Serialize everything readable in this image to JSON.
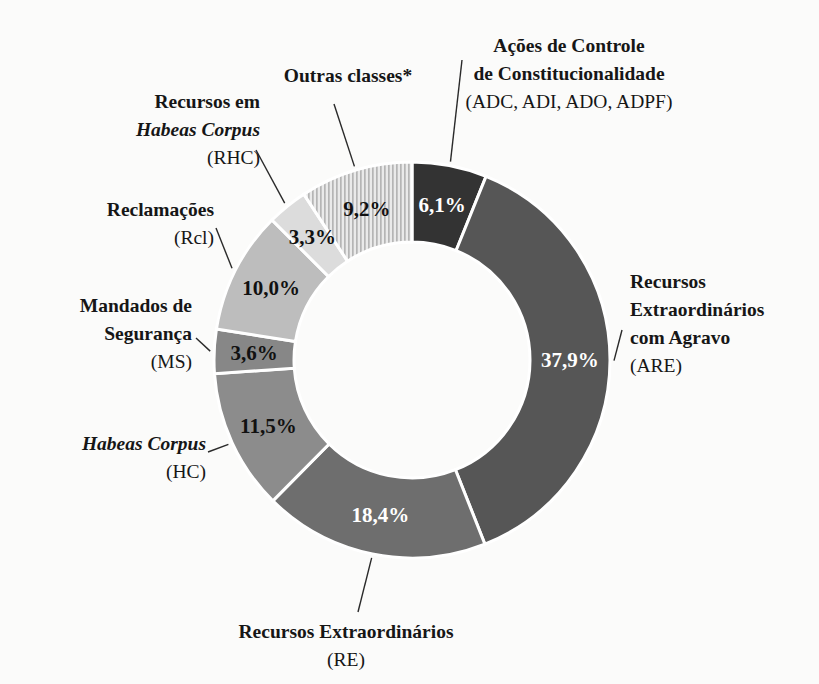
{
  "chart_data": {
    "type": "pie",
    "variant": "donut",
    "title": "",
    "subtitle": "",
    "xlabel": "",
    "ylabel": "",
    "legend_position": "callout-labels",
    "grid": false,
    "value_suffix": "%",
    "decimal_separator": ",",
    "start_angle_deg": 0,
    "direction": "clockwise",
    "categories": [
      "Ações de Controle de Constitucionalidade (ADC, ADI, ADO, ADPF)",
      "Recursos Extraordinários com Agravo (ARE)",
      "Recursos Extraordinários (RE)",
      "Habeas Corpus (HC)",
      "Mandados de Segurança (MS)",
      "Reclamações (Rcl)",
      "Recursos em Habeas Corpus (RHC)",
      "Outras classes*"
    ],
    "values": [
      6.1,
      37.9,
      18.4,
      11.5,
      3.6,
      10.0,
      3.3,
      9.2
    ],
    "value_labels": [
      "6,1%",
      "37,9%",
      "18,4%",
      "11,5%",
      "3,6%",
      "10,0%",
      "3,3%",
      "9,2%"
    ],
    "slice_colors": [
      "#333333",
      "#565656",
      "#6e6e6e",
      "#8c8c8c",
      "#878787",
      "#bdbdbd",
      "#dcdcdc",
      "#c9c9c9"
    ],
    "slice_patterns": [
      "solid",
      "solid",
      "solid",
      "solid",
      "solid",
      "solid",
      "solid",
      "vertical-stripes"
    ],
    "label_text_colors": [
      "#ffffff",
      "#ffffff",
      "#ffffff",
      "#111111",
      "#111111",
      "#111111",
      "#111111",
      "#111111"
    ]
  },
  "slices": [
    {
      "id": "adc",
      "pct": "6,1%",
      "lines": [
        {
          "text": "Ações de Controle",
          "style": "bold"
        },
        {
          "text": "de Constitucionalidade",
          "style": "bold"
        },
        {
          "text": "(ADC, ADI, ADO, ADPF)",
          "style": "code"
        }
      ]
    },
    {
      "id": "are",
      "pct": "37,9%",
      "lines": [
        {
          "text": "Recursos",
          "style": "bold"
        },
        {
          "text": "Extraordinários",
          "style": "bold"
        },
        {
          "text": "com Agravo",
          "style": "bold"
        },
        {
          "text": "(ARE)",
          "style": "code"
        }
      ]
    },
    {
      "id": "re",
      "pct": "18,4%",
      "lines": [
        {
          "text": "Recursos Extraordinários",
          "style": "bold"
        },
        {
          "text": "(RE)",
          "style": "code"
        }
      ]
    },
    {
      "id": "hc",
      "pct": "11,5%",
      "lines": [
        {
          "text": "Habeas Corpus",
          "style": "bold-italic"
        },
        {
          "text": "(HC)",
          "style": "code"
        }
      ]
    },
    {
      "id": "ms",
      "pct": "3,6%",
      "lines": [
        {
          "text": "Mandados de",
          "style": "bold"
        },
        {
          "text": "Segurança",
          "style": "bold"
        },
        {
          "text": "(MS)",
          "style": "code"
        }
      ]
    },
    {
      "id": "rcl",
      "pct": "10,0%",
      "lines": [
        {
          "text": "Reclamações",
          "style": "bold"
        },
        {
          "text": "(Rcl)",
          "style": "code"
        }
      ]
    },
    {
      "id": "rhc",
      "pct": "3,3%",
      "lines": [
        {
          "text": "Recursos em",
          "style": "bold"
        },
        {
          "text": "Habeas Corpus",
          "style": "bold-italic"
        },
        {
          "text": "(RHC)",
          "style": "code"
        }
      ]
    },
    {
      "id": "out",
      "pct": "9,2%",
      "lines": [
        {
          "text": "Outras classes*",
          "style": "bold"
        }
      ]
    }
  ],
  "callouts": {
    "adc": {
      "l1": "Ações de Controle",
      "l2": "de Constitucionalidade",
      "l3": "(ADC, ADI, ADO, ADPF)"
    },
    "are": {
      "l1": "Recursos",
      "l2": "Extraordinários",
      "l3": "com Agravo",
      "l4": "(ARE)"
    },
    "re": {
      "l1": "Recursos Extraordinários",
      "l2": "(RE)"
    },
    "hc": {
      "l1": "Habeas Corpus",
      "l2": "(HC)"
    },
    "ms": {
      "l1": "Mandados de",
      "l2": "Segurança",
      "l3": "(MS)"
    },
    "rcl": {
      "l1": "Reclamações",
      "l2": "(Rcl)"
    },
    "rhc": {
      "l1": "Recursos em",
      "l2": "Habeas Corpus",
      "l3": "(RHC)"
    },
    "out": {
      "l1": "Outras classes*"
    }
  },
  "percent_labels": {
    "adc": "6,1%",
    "are": "37,9%",
    "re": "18,4%",
    "hc": "11,5%",
    "ms": "3,6%",
    "rcl": "10,0%",
    "rhc": "3,3%",
    "out": "9,2%"
  },
  "geometry": {
    "cx": 412,
    "cy": 360,
    "outer_r": 198,
    "inner_r": 118
  }
}
